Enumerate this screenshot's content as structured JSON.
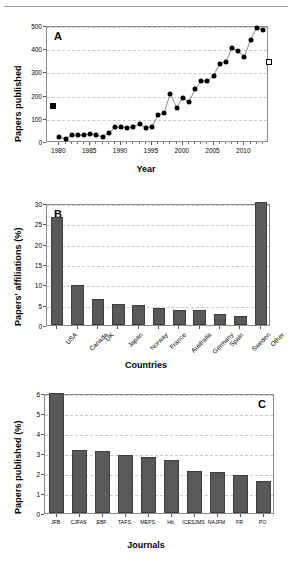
{
  "figure": {
    "panels": [
      "A",
      "B",
      "C"
    ]
  },
  "chart_data": [
    {
      "type": "scatter",
      "panel": "A",
      "title": "",
      "xlabel": "Year",
      "ylabel": "Papers published",
      "xlim": [
        1978,
        2014
      ],
      "ylim": [
        0,
        500
      ],
      "yticks": [
        0,
        100,
        200,
        300,
        400,
        500
      ],
      "xticks": [
        1980,
        1985,
        1990,
        1995,
        2000,
        2005,
        2010
      ],
      "grid": "horizontal-dashed",
      "legend": "none",
      "series": [
        {
          "name": "Papers published per year",
          "marker": "filled-circle",
          "x": [
            1980,
            1981,
            1982,
            1983,
            1984,
            1985,
            1986,
            1987,
            1988,
            1989,
            1990,
            1991,
            1992,
            1993,
            1994,
            1995,
            1996,
            1997,
            1998,
            1999,
            2000,
            2001,
            2002,
            2003,
            2004,
            2005,
            2006,
            2007,
            2008,
            2009,
            2010,
            2011,
            2012,
            2013
          ],
          "y": [
            28,
            16,
            34,
            35,
            33,
            40,
            33,
            28,
            43,
            67,
            69,
            64,
            71,
            81,
            66,
            69,
            119,
            131,
            213,
            152,
            196,
            176,
            231,
            268,
            268,
            289,
            342,
            350,
            410,
            396,
            371,
            444,
            497,
            487
          ]
        },
        {
          "name": "Pre-1980 marker",
          "marker": "filled-square",
          "x": [
            1979
          ],
          "y": [
            160
          ]
        },
        {
          "name": "Projected marker",
          "marker": "open-square",
          "x": [
            2014
          ],
          "y": [
            350
          ]
        }
      ]
    },
    {
      "type": "bar",
      "panel": "B",
      "title": "",
      "xlabel": "Countries",
      "ylabel": "Papers' affiliations (%)",
      "ylim": [
        0,
        30
      ],
      "yticks": [
        0,
        5,
        10,
        15,
        20,
        25,
        30
      ],
      "grid": "horizontal-dashed",
      "categories": [
        "USA",
        "Canada",
        "UK",
        "Japan",
        "Norway",
        "France",
        "Australia",
        "Germany",
        "Spain",
        "Sweden",
        "Other"
      ],
      "values": [
        26.6,
        9.8,
        6.5,
        5.1,
        4.8,
        4.1,
        3.8,
        3.7,
        2.8,
        2.2,
        30.2
      ]
    },
    {
      "type": "bar",
      "panel": "C",
      "title": "",
      "xlabel": "Journals",
      "ylabel": "Papers published (%)",
      "ylim": [
        0,
        6
      ],
      "yticks": [
        0,
        1,
        2,
        3,
        4,
        5,
        6
      ],
      "grid": "horizontal-dashed",
      "categories": [
        "JFB",
        "CJFAS",
        "EBF",
        "TAFS",
        "MEPS",
        "Hb",
        "ICESJMS",
        "NAJFM",
        "FR",
        "PO"
      ],
      "values": [
        6.0,
        3.15,
        3.12,
        2.9,
        2.82,
        2.67,
        2.1,
        2.05,
        1.92,
        1.6
      ]
    }
  ]
}
